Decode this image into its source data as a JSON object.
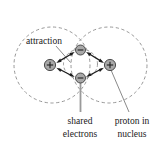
{
  "figure": {
    "width": 164,
    "height": 147,
    "background_color": "#ffffff"
  },
  "labels": {
    "attraction": "attraction",
    "shared_line1": "shared",
    "shared_line2": "electrons",
    "proton_line1": "proton in",
    "proton_line2": "nucleus"
  },
  "colors": {
    "orbital_stroke": "#8c8c8c",
    "arrow": "#1c1c1c",
    "particle_fill": "#a8a8a8",
    "particle_stroke": "#3c3c3c",
    "leader": "#7d7d7d",
    "leader_thick": "#9a9a9a",
    "text": "#1a1a1a"
  },
  "geometry": {
    "orbitals": [
      {
        "name": "left-electron-cloud",
        "cx": 52,
        "cy": 65,
        "r": 38
      },
      {
        "name": "right-electron-cloud",
        "cx": 109,
        "cy": 65,
        "r": 38
      }
    ],
    "inner_orbital": {
      "cx": 80.5,
      "cy": 64,
      "rx": 17,
      "ry": 15
    },
    "protons": [
      {
        "name": "left-proton",
        "cx": 50,
        "cy": 65,
        "r": 5.6,
        "charge": "+"
      },
      {
        "name": "right-proton",
        "cx": 110,
        "cy": 65,
        "r": 5.6,
        "charge": "+"
      }
    ],
    "electrons": [
      {
        "name": "top-electron",
        "cx": 80.5,
        "cy": 50,
        "r": 5.0,
        "charge": "-"
      },
      {
        "name": "bottom-electron",
        "cx": 80.5,
        "cy": 78,
        "r": 5.0,
        "charge": "-"
      }
    ],
    "attraction_arrows": [
      {
        "name": "left-proton-to-top-electron",
        "x1": 57,
        "y1": 62,
        "x2": 74,
        "y2": 52
      },
      {
        "name": "left-proton-to-bottom-electron",
        "x1": 57,
        "y1": 69,
        "x2": 74,
        "y2": 76
      },
      {
        "name": "right-proton-to-top-electron",
        "x1": 103,
        "y1": 62,
        "x2": 87,
        "y2": 52
      },
      {
        "name": "right-proton-to-bottom-electron",
        "x1": 103,
        "y1": 69,
        "x2": 87,
        "y2": 76
      }
    ],
    "leaders": [
      {
        "name": "attraction-leader",
        "x1": 56,
        "y1": 46,
        "x2": 70,
        "y2": 62
      },
      {
        "name": "shared-electrons-leader",
        "x1": 80.5,
        "y1": 82,
        "x2": 80.5,
        "y2": 111
      },
      {
        "name": "proton-nucleus-leader",
        "x1": 111,
        "y1": 70,
        "x2": 129,
        "y2": 112
      }
    ],
    "label_positions": {
      "attraction": {
        "x": 44,
        "y": 44
      },
      "shared_line1": {
        "x": 80,
        "y": 124
      },
      "shared_line2": {
        "x": 80,
        "y": 137
      },
      "proton_line1": {
        "x": 132,
        "y": 124
      },
      "proton_line2": {
        "x": 132,
        "y": 137
      }
    }
  }
}
